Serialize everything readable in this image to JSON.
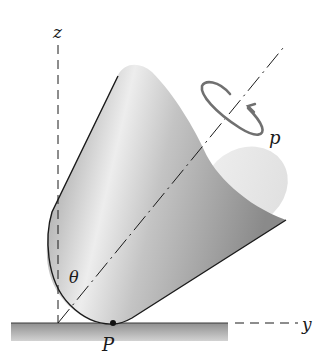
{
  "diagram": {
    "labels": {
      "z_axis": "z",
      "y_axis": "y",
      "spin_rate": "p",
      "tilt_angle": "θ",
      "contact_point": "P"
    },
    "colors": {
      "ink": "#1a1a1a",
      "cone_dark": "#8c8c8c",
      "cone_light": "#e6e6e6",
      "ground": "#a8a8a8",
      "spin_arrow": "#6e6e6e"
    }
  }
}
